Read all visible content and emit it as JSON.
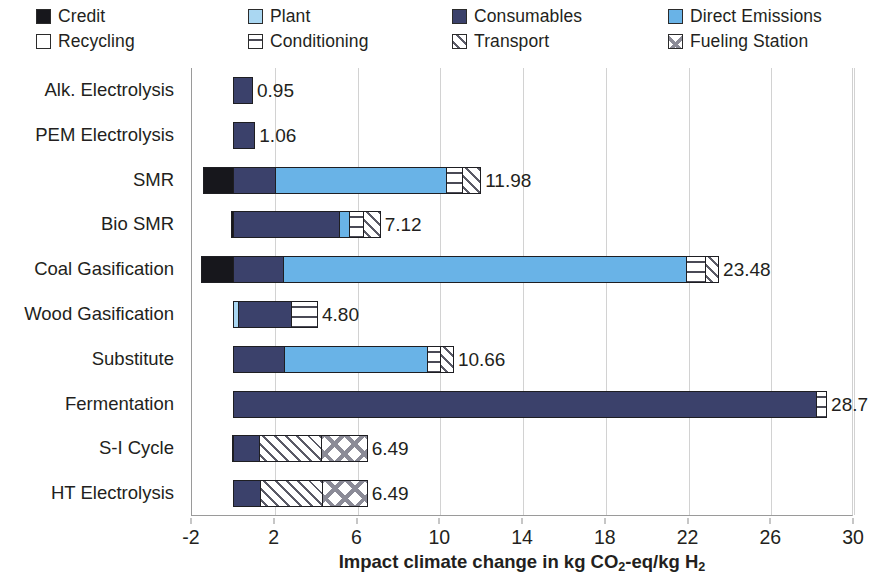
{
  "legend": {
    "items": [
      {
        "label": "Credit",
        "icon": "swatch-credit",
        "fill": "fill-credit",
        "color": "#17171c",
        "col": 0,
        "row": 0
      },
      {
        "label": "Plant",
        "icon": "swatch-plant",
        "fill": "fill-plant",
        "color": "#aad7f2",
        "col": 1,
        "row": 0
      },
      {
        "label": "Consumables",
        "icon": "swatch-consumables",
        "fill": "fill-consumables",
        "color": "#3b416b",
        "col": 2,
        "row": 0
      },
      {
        "label": "Direct Emissions",
        "icon": "swatch-direct",
        "fill": "fill-direct",
        "color": "#69b3e7",
        "col": 3,
        "row": 0
      },
      {
        "label": "Recycling",
        "icon": "swatch-recycling",
        "fill": "fill-recycling",
        "color": "#ffffff",
        "col": 0,
        "row": 1
      },
      {
        "label": "Conditioning",
        "icon": "swatch-conditioning",
        "fill": "fill-conditioning",
        "color": "#ffffff",
        "col": 1,
        "row": 1
      },
      {
        "label": "Transport",
        "icon": "swatch-transport",
        "fill": "fill-transport",
        "color": "#ffffff",
        "col": 2,
        "row": 1
      },
      {
        "label": "Fueling Station",
        "icon": "swatch-fueling",
        "fill": "fill-fueling",
        "color": "#ffffff",
        "col": 3,
        "row": 1
      }
    ],
    "col_x": [
      36,
      248,
      452,
      668
    ],
    "row_y": [
      8,
      33
    ]
  },
  "axis": {
    "x_title_pre": "Impact climate change in kg CO",
    "x_title_sub1": "2",
    "x_title_mid": "-eq/kg H",
    "x_title_sub2": "2",
    "x_title_full": "Impact climate change in kg CO2-eq/kg H2",
    "x_ticks": [
      "-2",
      "2",
      "6",
      "10",
      "14",
      "18",
      "22",
      "26",
      "30"
    ],
    "x_tick_values": [
      -2,
      2,
      6,
      10,
      14,
      18,
      22,
      26,
      30
    ],
    "x_min": -2,
    "x_max": 30
  },
  "chart_data": {
    "type": "bar",
    "orientation": "horizontal",
    "stacked": true,
    "title": "",
    "subtitle": "",
    "xlabel": "Impact climate change in kg CO2-eq/kg H2",
    "ylabel": "",
    "xlim": [
      -2,
      30
    ],
    "grid": true,
    "grid_axis": "x",
    "legend_position": "top",
    "categories": [
      "Alk. Electrolysis",
      "PEM Electrolysis",
      "SMR",
      "Bio SMR",
      "Coal Gasification",
      "Wood Gasification",
      "Substitute",
      "Fermentation",
      "S-I Cycle",
      "HT Electrolysis"
    ],
    "series": [
      {
        "name": "Credit",
        "fill": "fill-credit",
        "values": [
          0,
          0,
          -1.45,
          -0.12,
          -1.55,
          0,
          0,
          0,
          -0.07,
          0
        ]
      },
      {
        "name": "Plant",
        "fill": "fill-plant",
        "values": [
          0,
          0,
          0,
          0,
          0,
          0.22,
          0,
          0,
          0,
          0
        ]
      },
      {
        "name": "Consumables",
        "fill": "fill-consumables",
        "values": [
          0.95,
          1.06,
          2.02,
          5.18,
          2.42,
          2.62,
          2.45,
          28.25,
          1.25,
          1.3
        ]
      },
      {
        "name": "Direct Emissions",
        "fill": "fill-direct",
        "values": [
          0,
          0,
          8.32,
          0.5,
          19.57,
          0,
          6.98,
          0,
          0,
          0
        ]
      },
      {
        "name": "Recycling",
        "fill": "fill-recycling",
        "values": [
          0,
          0,
          0,
          0,
          0,
          0,
          0,
          0,
          0,
          0
        ]
      },
      {
        "name": "Conditioning",
        "fill": "fill-conditioning",
        "values": [
          0,
          0,
          0.79,
          0.68,
          0.9,
          1.25,
          0.64,
          0.45,
          0,
          0
        ]
      },
      {
        "name": "Transport",
        "fill": "fill-transport",
        "values": [
          0,
          0,
          0.85,
          0.76,
          0.59,
          0,
          0.59,
          0,
          3.04,
          3.04
        ]
      },
      {
        "name": "Fueling Station",
        "fill": "fill-fueling",
        "values": [
          0,
          0,
          0,
          0,
          0,
          0,
          0,
          0,
          2.2,
          2.15
        ]
      }
    ],
    "totals": [
      0.95,
      1.06,
      11.98,
      7.12,
      23.48,
      4.8,
      10.66,
      28.7,
      6.49,
      6.49
    ],
    "total_labels": [
      "0.95",
      "1.06",
      "11.98",
      "7.12",
      "23.48",
      "4.80",
      "10.66",
      "28.7",
      "6.49",
      "6.49"
    ]
  }
}
